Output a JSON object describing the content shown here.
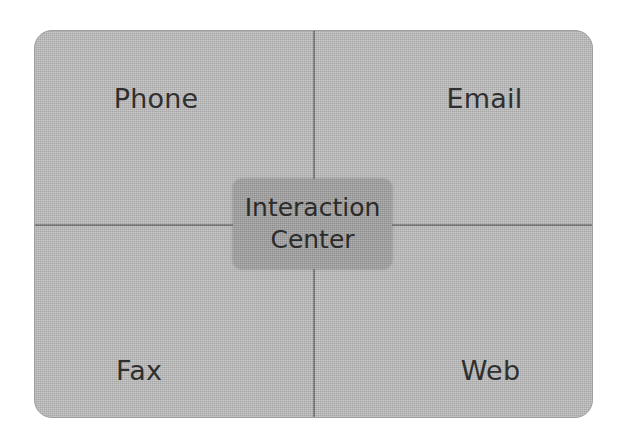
{
  "diagram": {
    "type": "quadrant-hub",
    "colors": {
      "panel_background": "#b6b6b6",
      "panel_border": "#9e9e9e",
      "divider": "#6f6f6f",
      "hub_background": "#9b9b9b",
      "label_text": "#2f2f2f",
      "canvas_background": "#ffffff"
    },
    "center": {
      "line1": "Interaction",
      "line2": "Center"
    },
    "quadrants": [
      {
        "id": "phone",
        "label": "Phone",
        "position": "top-left"
      },
      {
        "id": "email",
        "label": "Email",
        "position": "top-right"
      },
      {
        "id": "fax",
        "label": "Fax",
        "position": "bottom-left"
      },
      {
        "id": "web",
        "label": "Web",
        "position": "bottom-right"
      }
    ]
  }
}
